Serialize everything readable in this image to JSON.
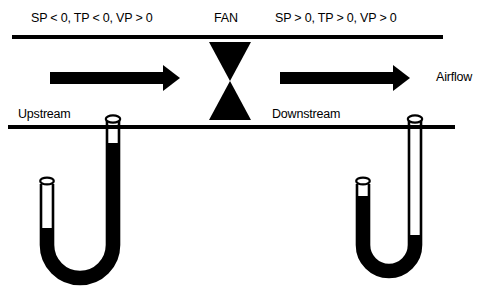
{
  "figure": {
    "colors": {
      "ink": "#000000",
      "background": "#ffffff",
      "fluid": "#000000"
    },
    "labels": {
      "upstream_conditions": "SP < 0, TP < 0, VP > 0",
      "fan": "FAN",
      "downstream_conditions": "SP > 0, TP > 0, VP > 0",
      "upstream": "Upstream",
      "downstream": "Downstream",
      "airflow": "Airflow"
    },
    "elements": {
      "duct_top_wall": "duct-top-wall",
      "duct_bottom_wall": "duct-bottom-wall",
      "fan_symbol": "fan-bowtie-symbol",
      "arrow_upstream": "airflow-arrow-upstream",
      "arrow_downstream": "airflow-arrow-downstream",
      "manometer_upstream": "u-tube-manometer-upstream",
      "manometer_downstream": "u-tube-manometer-downstream"
    }
  }
}
